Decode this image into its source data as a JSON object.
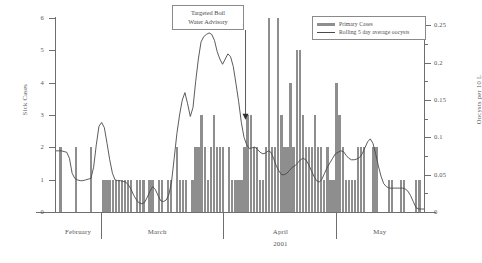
{
  "chart_data": {
    "type": "bar",
    "title": "",
    "xlabel": "2001",
    "ylabel": "Sick Cases",
    "y2label": "Oocysts per 10 L",
    "ylim": [
      0,
      6
    ],
    "y2lim": [
      0,
      0.26
    ],
    "grid": false,
    "legend_position": "top-right",
    "yticks": [
      "0",
      "1",
      "2",
      "3",
      "4",
      "5",
      "6"
    ],
    "y2ticks": [
      "0",
      "0.05",
      "0.1",
      "0.15",
      "0.2",
      "0.25"
    ],
    "months": [
      {
        "label": "February",
        "center_pct": 6.0
      },
      {
        "label": "March",
        "center_pct": 27.5
      },
      {
        "label": "April",
        "center_pct": 61.0
      },
      {
        "label": "May",
        "center_pct": 88.0
      }
    ],
    "month_boundaries_pct": [
      12.2,
      45.5,
      76.0
    ],
    "series": [
      {
        "name": "Primary Cases",
        "type": "bar",
        "axis": "left",
        "color": "#8e8e8e",
        "values": [
          0,
          2,
          0,
          0,
          0,
          0,
          2,
          0,
          0,
          0,
          0,
          2,
          0,
          0,
          0,
          1,
          1,
          1,
          1,
          1,
          1,
          1,
          1,
          1,
          1,
          0,
          1,
          1,
          1,
          0,
          1,
          1,
          0,
          1,
          1,
          0,
          1,
          1,
          0,
          2,
          1,
          1,
          1,
          0,
          1,
          2,
          2,
          3,
          2,
          1,
          2,
          3,
          2,
          2,
          2,
          0,
          2,
          1,
          1,
          1,
          1,
          2,
          3,
          3,
          2,
          2,
          1,
          1,
          2,
          6,
          2,
          2,
          6,
          3,
          2,
          2,
          4,
          2,
          5,
          5,
          3,
          2,
          2,
          2,
          3,
          2,
          2,
          1,
          2,
          1,
          1,
          4,
          3,
          2,
          1,
          1,
          1,
          1,
          2,
          2,
          2,
          0,
          0,
          2,
          2,
          0,
          0,
          0,
          1,
          1,
          0,
          0,
          1,
          1,
          0,
          0,
          0,
          1,
          1,
          0
        ]
      },
      {
        "name": "Rolling 5 day average oocysts",
        "type": "line",
        "axis": "right",
        "color": "#4a4a4a",
        "values": [
          0.082,
          0.082,
          0.082,
          0.081,
          0.08,
          0.072,
          0.052,
          0.045,
          0.043,
          0.042,
          0.042,
          0.043,
          0.044,
          0.045,
          0.06,
          0.09,
          0.115,
          0.12,
          0.113,
          0.092,
          0.07,
          0.052,
          0.043,
          0.042,
          0.042,
          0.041,
          0.04,
          0.036,
          0.03,
          0.022,
          0.016,
          0.012,
          0.011,
          0.013,
          0.02,
          0.028,
          0.034,
          0.03,
          0.022,
          0.015,
          0.014,
          0.016,
          0.023,
          0.04,
          0.072,
          0.105,
          0.13,
          0.15,
          0.16,
          0.145,
          0.128,
          0.14,
          0.175,
          0.205,
          0.228,
          0.235,
          0.238,
          0.24,
          0.238,
          0.23,
          0.215,
          0.205,
          0.198,
          0.205,
          0.212,
          0.208,
          0.195,
          0.172,
          0.148,
          0.12,
          0.1,
          0.09,
          0.085,
          0.086,
          0.087,
          0.084,
          0.08,
          0.078,
          0.079,
          0.082,
          0.08,
          0.072,
          0.062,
          0.055,
          0.05,
          0.05,
          0.052,
          0.056,
          0.06,
          0.062,
          0.066,
          0.07,
          0.072,
          0.07,
          0.064,
          0.056,
          0.048,
          0.042,
          0.04,
          0.044,
          0.052,
          0.06,
          0.066,
          0.072,
          0.078,
          0.08,
          0.082,
          0.081,
          0.076,
          0.072,
          0.07,
          0.07,
          0.071,
          0.073,
          0.078,
          0.086,
          0.094,
          0.098,
          0.092,
          0.078,
          0.062,
          0.048,
          0.038,
          0.034,
          0.032,
          0.032,
          0.032,
          0.032,
          0.032,
          0.032,
          0.031,
          0.028,
          0.022,
          0.014,
          0.006,
          0.004,
          0.004,
          0.004
        ]
      }
    ],
    "annotations": [
      {
        "name": "targeted-boil-water-advisory",
        "line1": "Targeted Boil",
        "line2": "Water Advisory",
        "arrow_x_pct": 51.5,
        "arrow_tip_value": 2.85
      }
    ]
  }
}
